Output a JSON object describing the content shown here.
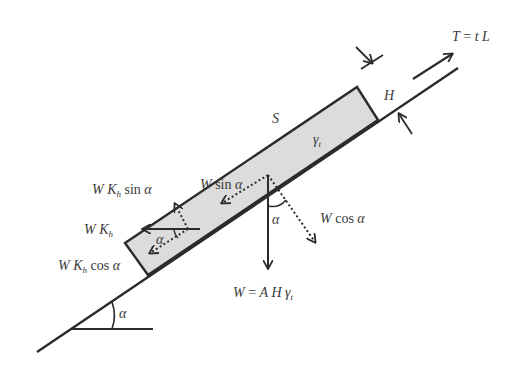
{
  "diagram": {
    "colors": {
      "stroke": "#2b2b2b",
      "block_fill": "#dcdcdc",
      "text": "#3a3a3a"
    },
    "labels": {
      "tension": {
        "lhs": "T",
        "eq": " = ",
        "rhs": "t L"
      },
      "thickness": "H",
      "surface": "S",
      "unit_weight": {
        "sym": "γ",
        "sub": "t"
      },
      "w_sin": {
        "w": "W ",
        "fn": "sin ",
        "ang": "α"
      },
      "w_cos": {
        "w": "W ",
        "fn": "cos ",
        "ang": "α"
      },
      "wkh_sin": {
        "w": "W K",
        "sub": "h",
        "fn": " sin ",
        "ang": "α"
      },
      "wkh": {
        "w": "W K",
        "sub": "h"
      },
      "wkh_cos": {
        "w": "W K",
        "sub": "h",
        "fn": " cos ",
        "ang": "α"
      },
      "weight": {
        "lhs": "W",
        "eq": " = ",
        "rhs": "A H γ",
        "sub": "t"
      },
      "alpha_center": "α",
      "alpha_block": "α",
      "alpha_base": "α"
    }
  }
}
